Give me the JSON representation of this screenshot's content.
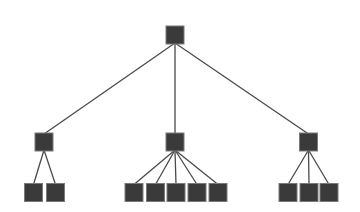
{
  "diagram": {
    "type": "tree",
    "background": "#ffffff",
    "node_color": "#3a3a3a",
    "node_border_color": "#7a7a7a",
    "edge_color": "#4a4a4a",
    "node_size": 18,
    "nodes": [
      {
        "id": "root",
        "level": 0,
        "x": 175,
        "y": 35,
        "parent": null
      },
      {
        "id": "mid-left",
        "level": 1,
        "x": 44,
        "y": 142,
        "parent": "root"
      },
      {
        "id": "mid-center",
        "level": 1,
        "x": 175,
        "y": 142,
        "parent": "root"
      },
      {
        "id": "mid-right",
        "level": 1,
        "x": 308.5,
        "y": 142,
        "parent": "root"
      },
      {
        "id": "leaf-left-1",
        "level": 2,
        "x": 33.5,
        "y": 192.5,
        "parent": "mid-left"
      },
      {
        "id": "leaf-left-2",
        "level": 2,
        "x": 55.5,
        "y": 192.5,
        "parent": "mid-left"
      },
      {
        "id": "leaf-center-1",
        "level": 2,
        "x": 134,
        "y": 192.5,
        "parent": "mid-center"
      },
      {
        "id": "leaf-center-2",
        "level": 2,
        "x": 155.5,
        "y": 192.5,
        "parent": "mid-center"
      },
      {
        "id": "leaf-center-3",
        "level": 2,
        "x": 176,
        "y": 192.5,
        "parent": "mid-center"
      },
      {
        "id": "leaf-center-4",
        "level": 2,
        "x": 197,
        "y": 192.5,
        "parent": "mid-center"
      },
      {
        "id": "leaf-center-5",
        "level": 2,
        "x": 218,
        "y": 192.5,
        "parent": "mid-center"
      },
      {
        "id": "leaf-right-1",
        "level": 2,
        "x": 288,
        "y": 192.5,
        "parent": "mid-right"
      },
      {
        "id": "leaf-right-2",
        "level": 2,
        "x": 309,
        "y": 192.5,
        "parent": "mid-right"
      },
      {
        "id": "leaf-right-3",
        "level": 2,
        "x": 329,
        "y": 192.5,
        "parent": "mid-right"
      }
    ]
  }
}
